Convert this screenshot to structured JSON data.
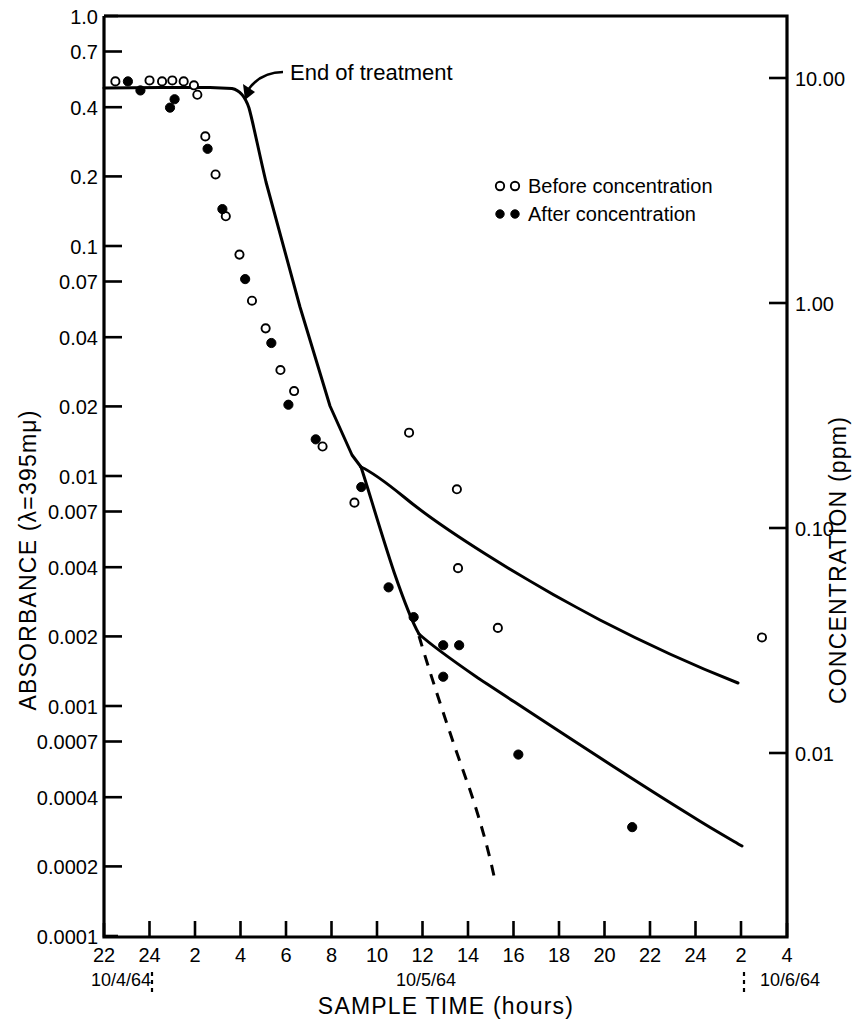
{
  "figure": {
    "kind": "scientific-log-plot",
    "background": "#ffffff",
    "ink": "#000000"
  },
  "chart_data": {
    "type": "line",
    "title": "",
    "subtitle": "",
    "xlabel": "SAMPLE  TIME (hours)",
    "ylabel": "ABSORBANCE (λ=395mμ)",
    "y2label": "CONCENTRATION  (ppm)",
    "xscale": "linear-clock-hours",
    "yscale": "log",
    "y2scale": "log",
    "grid": false,
    "legend_position": "upper-right-inside",
    "xlim_hours": [
      22,
      52
    ],
    "ylim": [
      0.0001,
      1.0
    ],
    "y2lim": [
      0.002,
      20.0
    ],
    "x_tick_labels": [
      "22",
      "24",
      "2",
      "4",
      "6",
      "8",
      "10",
      "12",
      "14",
      "16",
      "18",
      "20",
      "22",
      "24",
      "2",
      "4"
    ],
    "x_tick_hours": [
      22,
      24,
      26,
      28,
      30,
      32,
      34,
      36,
      38,
      40,
      42,
      44,
      46,
      48,
      50,
      52
    ],
    "y_tick_labels": [
      "1.0",
      "0.7",
      "0.4",
      "0.2",
      "0.1",
      "0.07",
      "0.04",
      "0.02",
      "0.01",
      "0.007",
      "0.004",
      "0.002",
      "0.001",
      "0.0007",
      "0.0004",
      "0.0002",
      "0.0001"
    ],
    "y_tick_values": [
      1.0,
      0.7,
      0.4,
      0.2,
      0.1,
      0.07,
      0.04,
      0.02,
      0.01,
      0.007,
      0.004,
      0.002,
      0.001,
      0.0007,
      0.0004,
      0.0002,
      0.0001
    ],
    "y2_tick_labels": [
      "10.00",
      "1.00",
      "0.10",
      "0.01"
    ],
    "y2_tick_values": [
      10.0,
      1.0,
      0.1,
      0.01
    ],
    "date_markers": [
      {
        "label": "10/4/64",
        "hour": 23.0,
        "tick_hour": 24
      },
      {
        "label": "10/5/64",
        "hour": 35.0,
        "tick_hour": 34
      },
      {
        "label": "10/6/64",
        "hour": 49.6,
        "tick_hour": 48
      }
    ],
    "annotations": [
      {
        "text": "End of treatment",
        "hour": 29.5,
        "value": 0.56,
        "points_to_hour": 25.05,
        "points_to_value": 0.47
      }
    ],
    "legend": [
      {
        "marker": "open-circle",
        "label": "Before concentration"
      },
      {
        "marker": "filled-circle",
        "label": "After concentration"
      }
    ],
    "series": [
      {
        "name": "Before concentration",
        "marker": "open-circle",
        "points": [
          {
            "hour": 22.5,
            "value": 0.52
          },
          {
            "hour": 24.0,
            "value": 0.525
          },
          {
            "hour": 24.55,
            "value": 0.52
          },
          {
            "hour": 25.0,
            "value": 0.525
          },
          {
            "hour": 25.5,
            "value": 0.52
          },
          {
            "hour": 25.95,
            "value": 0.5
          },
          {
            "hour": 26.1,
            "value": 0.455
          },
          {
            "hour": 26.45,
            "value": 0.3
          },
          {
            "hour": 26.9,
            "value": 0.205
          },
          {
            "hour": 27.35,
            "value": 0.135
          },
          {
            "hour": 27.95,
            "value": 0.092
          },
          {
            "hour": 28.5,
            "value": 0.058
          },
          {
            "hour": 29.1,
            "value": 0.044
          },
          {
            "hour": 29.75,
            "value": 0.029
          },
          {
            "hour": 30.35,
            "value": 0.0235
          },
          {
            "hour": 31.6,
            "value": 0.0135
          },
          {
            "hour": 33.0,
            "value": 0.0077
          },
          {
            "hour": 35.4,
            "value": 0.0155
          },
          {
            "hour": 37.5,
            "value": 0.0088
          },
          {
            "hour": 37.55,
            "value": 0.004
          },
          {
            "hour": 39.3,
            "value": 0.0022
          },
          {
            "hour": 50.9,
            "value": 0.002
          }
        ]
      },
      {
        "name": "After concentration",
        "marker": "filled-circle",
        "points": [
          {
            "hour": 23.05,
            "value": 0.52
          },
          {
            "hour": 23.6,
            "value": 0.475
          },
          {
            "hour": 24.9,
            "value": 0.4
          },
          {
            "hour": 25.1,
            "value": 0.435
          },
          {
            "hour": 26.55,
            "value": 0.265
          },
          {
            "hour": 27.2,
            "value": 0.145
          },
          {
            "hour": 28.2,
            "value": 0.072
          },
          {
            "hour": 29.35,
            "value": 0.038
          },
          {
            "hour": 30.1,
            "value": 0.0205
          },
          {
            "hour": 31.3,
            "value": 0.0145
          },
          {
            "hour": 33.3,
            "value": 0.009
          },
          {
            "hour": 34.5,
            "value": 0.0033
          },
          {
            "hour": 35.6,
            "value": 0.00245
          },
          {
            "hour": 36.9,
            "value": 0.00185
          },
          {
            "hour": 37.6,
            "value": 0.00185
          },
          {
            "hour": 36.9,
            "value": 0.00135
          },
          {
            "hour": 40.2,
            "value": 0.00062
          },
          {
            "hour": 45.2,
            "value": 0.0003
          }
        ]
      }
    ],
    "curves": [
      {
        "name": "main-decay-curve",
        "style": "solid"
      },
      {
        "name": "upper-tail-before-concentration",
        "style": "solid"
      },
      {
        "name": "lower-tail-after-concentration",
        "style": "solid"
      },
      {
        "name": "extrapolated-decay",
        "style": "dashed"
      }
    ]
  }
}
